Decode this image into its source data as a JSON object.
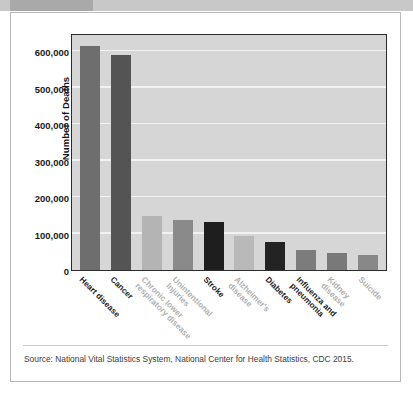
{
  "header": {
    "strip_color": "#c8c8c8",
    "strip_left_color": "#a9a9a9"
  },
  "figure": {
    "source_note": "Source: National Vital Statistics System, National Center for Health Statistics, CDC 2015."
  },
  "chart_data": {
    "type": "bar",
    "title": "",
    "xlabel": "",
    "ylabel": "Number of Deaths",
    "ylim": [
      0,
      650000
    ],
    "yticks": [
      0,
      100000,
      200000,
      300000,
      400000,
      500000,
      600000
    ],
    "ytick_labels": [
      "0",
      "100,000",
      "200,000",
      "300,000",
      "400,000",
      "500,000",
      "600,000"
    ],
    "grid": true,
    "legend": "none",
    "plot_background": "#d6d6d6",
    "gridline_color": "#f2f2f2",
    "categories": [
      "Heart disease",
      "Cancer",
      "Chronic lower\nrespiratory disease",
      "Unintentional\nInjuries",
      "Stroke",
      "Alzheimer's\ndisease",
      "Diabetes",
      "Influenza and\npneumonia",
      "Kidney disease",
      "Suicide"
    ],
    "values": [
      614000,
      591000,
      147000,
      136000,
      133000,
      93000,
      76000,
      55000,
      48000,
      42000
    ],
    "bar_colors": [
      "#6e6e6e",
      "#545454",
      "#b4b4b4",
      "#8a8a8a",
      "#1e1e1e",
      "#b9b9b9",
      "#232323",
      "#7c7c7c",
      "#797979",
      "#888888"
    ],
    "label_styles": [
      "dark",
      "dark",
      "light",
      "light",
      "dark",
      "light",
      "dark",
      "dark",
      "light",
      "light"
    ]
  }
}
